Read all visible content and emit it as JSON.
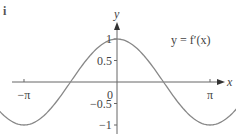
{
  "part_label": "i",
  "chart_data": {
    "type": "line",
    "title": "",
    "function_label": "y = f′(x)",
    "xlabel": "x",
    "ylabel": "y",
    "x_ticks": [
      "−2π",
      "−π",
      "0",
      "π",
      "2π"
    ],
    "x_tick_values": [
      -6.2832,
      -3.1416,
      0,
      3.1416,
      6.2832
    ],
    "y_ticks": [
      "1",
      "0.5",
      "−0.5",
      "−1"
    ],
    "y_tick_values": [
      1,
      0.5,
      -0.5,
      -1
    ],
    "xlim": [
      -6.2832,
      6.2832
    ],
    "ylim": [
      -1,
      1
    ],
    "grid": false,
    "series": [
      {
        "name": "f′(x) = cos x",
        "x": [
          -6.2832,
          -4.7124,
          -3.1416,
          -1.5708,
          0,
          1.5708,
          3.1416,
          4.7124,
          6.2832
        ],
        "values": [
          1,
          0,
          -1,
          0,
          1,
          0,
          -1,
          0,
          1
        ]
      }
    ],
    "color": "#888888"
  }
}
